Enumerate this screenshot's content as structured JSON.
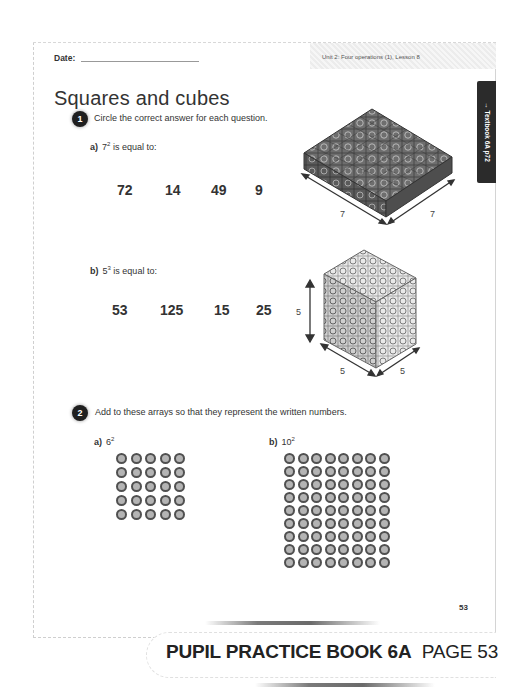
{
  "header": {
    "date_label": "Date:",
    "unit_label": "Unit 2: Four operations (1), Lesson 8"
  },
  "title": "Squares and cubes",
  "side_tab": {
    "label": "→ Textbook 6A p72"
  },
  "question1": {
    "number": "1",
    "instruction": "Circle the correct answer for each question.",
    "part_a": {
      "letter": "a)",
      "base": "7",
      "exponent": "2",
      "suffix": " is equal to:",
      "options": [
        "72",
        "14",
        "49",
        "9"
      ],
      "figure": {
        "type": "square-slab",
        "size": 7,
        "labels": [
          "7",
          "7"
        ]
      }
    },
    "part_b": {
      "letter": "b)",
      "base": "5",
      "exponent": "3",
      "suffix": " is equal to:",
      "options": [
        "53",
        "125",
        "15",
        "25"
      ],
      "figure": {
        "type": "cube",
        "size": 5,
        "labels": [
          "5",
          "5",
          "5"
        ]
      }
    }
  },
  "question2": {
    "number": "2",
    "instruction": "Add to these arrays so that they represent the written numbers.",
    "part_a": {
      "letter": "a)",
      "base": "6",
      "exponent": "2",
      "rows": 5,
      "cols": 5
    },
    "part_b": {
      "letter": "b)",
      "base": "10",
      "exponent": "2",
      "rows": 9,
      "cols": 8
    }
  },
  "page_number": "53",
  "footer": {
    "book": "PUPIL PRACTICE BOOK 6A",
    "page": "PAGE 53"
  },
  "colors": {
    "badge": "#1f1f1f",
    "dot_fill": "#b4b4b4",
    "dot_ring": "#505050",
    "cube_face": "#6a6a6a"
  }
}
